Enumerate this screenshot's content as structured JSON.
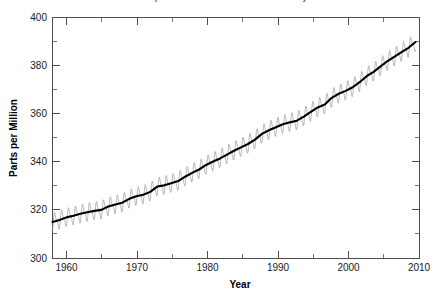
{
  "figure": {
    "title_clipped": "Atmospheric CO2 at Mauna Loa Observatory",
    "background_color": "#ffffff"
  },
  "chart_data": {
    "type": "line",
    "title": "Atmospheric CO2 at Mauna Loa Observatory",
    "xlabel": "Year",
    "ylabel": "Parts per Million",
    "xlim": [
      1958,
      2010.5
    ],
    "ylim": [
      300,
      400
    ],
    "grid": false,
    "legend": "none",
    "x_major_ticks": [
      1960,
      1970,
      1980,
      1990,
      2000,
      2010
    ],
    "x_major_tick_labels": [
      "1960",
      "1970",
      "1980",
      "1990",
      "2000",
      "2010"
    ],
    "x_minor_ticks": [
      1965,
      1975,
      1985,
      1995,
      2005
    ],
    "y_major_ticks": [
      300,
      320,
      340,
      360,
      380,
      400
    ],
    "y_major_tick_labels": [
      "300",
      "320",
      "340",
      "360",
      "380",
      "400"
    ],
    "y_minor_ticks": [
      310,
      330,
      350,
      370,
      390
    ],
    "seasonal_amplitude_ppm": 3.1,
    "series": [
      {
        "name": "Monthly mean CO2 (seasonal cycle)",
        "color": "#9a9a9a",
        "style": "thin-sawtooth"
      },
      {
        "name": "Smoothed annual trend",
        "color": "#000000",
        "style": "thick-line",
        "x": [
          1958,
          1959,
          1960,
          1961,
          1962,
          1963,
          1964,
          1965,
          1966,
          1967,
          1968,
          1969,
          1970,
          1971,
          1972,
          1973,
          1974,
          1975,
          1976,
          1977,
          1978,
          1979,
          1980,
          1981,
          1982,
          1983,
          1984,
          1985,
          1986,
          1987,
          1988,
          1989,
          1990,
          1991,
          1992,
          1993,
          1994,
          1995,
          1996,
          1997,
          1998,
          1999,
          2000,
          2001,
          2002,
          2003,
          2004,
          2005,
          2006,
          2007,
          2008,
          2009,
          2010
        ],
        "y": [
          315.0,
          315.8,
          316.9,
          317.6,
          318.4,
          319.0,
          319.6,
          320.0,
          321.4,
          322.2,
          323.0,
          324.6,
          325.7,
          326.3,
          327.5,
          329.7,
          330.2,
          331.1,
          332.0,
          333.8,
          335.4,
          336.8,
          338.7,
          340.1,
          341.4,
          343.0,
          344.6,
          346.0,
          347.4,
          349.2,
          351.6,
          353.1,
          354.4,
          355.6,
          356.4,
          357.1,
          358.8,
          360.8,
          362.6,
          363.8,
          366.6,
          368.3,
          369.5,
          371.0,
          373.1,
          375.6,
          377.4,
          379.7,
          381.9,
          383.7,
          385.6,
          387.4,
          389.8
        ]
      }
    ]
  },
  "axes": {
    "x_title": "Year",
    "y_title": "Parts per Million"
  }
}
